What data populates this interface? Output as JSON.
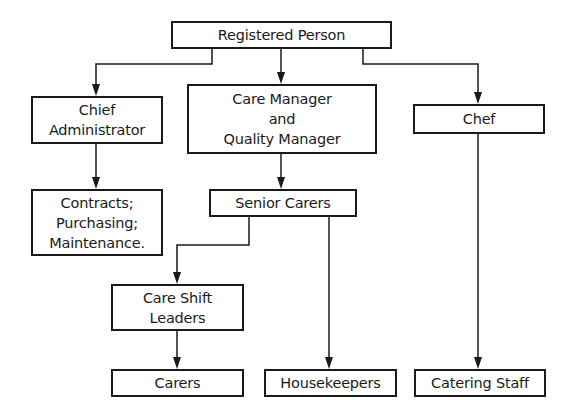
{
  "diagram": {
    "type": "org-chart",
    "nodes": {
      "registered_person": {
        "lines": [
          "Registered Person"
        ]
      },
      "chief_administrator": {
        "lines": [
          "Chief",
          "Administrator"
        ]
      },
      "care_manager": {
        "lines": [
          "Care Manager",
          "and",
          "Quality Manager"
        ]
      },
      "chef": {
        "lines": [
          "Chef"
        ]
      },
      "contracts": {
        "lines": [
          "Contracts;",
          "Purchasing;",
          "Maintenance."
        ]
      },
      "senior_carers": {
        "lines": [
          "Senior Carers"
        ]
      },
      "care_shift_leaders": {
        "lines": [
          "Care Shift",
          "Leaders"
        ]
      },
      "carers": {
        "lines": [
          "Carers"
        ]
      },
      "housekeepers": {
        "lines": [
          "Housekeepers"
        ]
      },
      "catering_staff": {
        "lines": [
          "Catering Staff"
        ]
      }
    },
    "edges": [
      {
        "from": "Registered Person",
        "to": "Chief Administrator"
      },
      {
        "from": "Registered Person",
        "to": "Care Manager and Quality Manager"
      },
      {
        "from": "Registered Person",
        "to": "Chef"
      },
      {
        "from": "Chief Administrator",
        "to": "Contracts; Purchasing; Maintenance."
      },
      {
        "from": "Care Manager and Quality Manager",
        "to": "Senior Carers"
      },
      {
        "from": "Senior Carers",
        "to": "Care Shift Leaders"
      },
      {
        "from": "Senior Carers",
        "to": "Housekeepers"
      },
      {
        "from": "Care Shift Leaders",
        "to": "Carers"
      },
      {
        "from": "Chef",
        "to": "Catering Staff"
      }
    ],
    "colors": {
      "line": "#1a1a1a",
      "background": "#ffffff"
    }
  }
}
